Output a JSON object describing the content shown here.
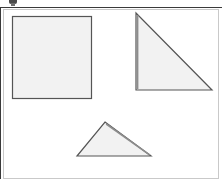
{
  "app": {
    "title": "Shapes Canvas",
    "width": 222,
    "height": 182,
    "background": "#ffffff"
  },
  "toolbar": {
    "nub_label": "",
    "nub_icon": "toolbar-handle-icon"
  },
  "canvas": {
    "frame_color": "#c9c9c9",
    "rule_color": "#3a3a3a",
    "background": "#ffffff"
  },
  "style": {
    "shape_fill": "#f2f2f2",
    "shape_stroke": "#555555",
    "shape_stroke_width": 1.2,
    "shadow_stroke": "#777777"
  },
  "shapes": [
    {
      "id": "square",
      "name": "square",
      "label": "Square",
      "type": "rect",
      "x": 12,
      "y": 16,
      "width": 79,
      "height": 82,
      "fill": "#f2f2f2",
      "stroke": "#555555"
    },
    {
      "id": "right-triangle",
      "name": "right-triangle",
      "label": "Right Triangle",
      "type": "polygon",
      "points": "136,13 136,90 212,90",
      "fill": "#f2f2f2",
      "stroke": "#555555"
    },
    {
      "id": "isosceles-triangle",
      "name": "isosceles-triangle",
      "label": "Isosceles Triangle",
      "type": "polygon",
      "points": "105,122 151,156 77,156",
      "fill": "#f2f2f2",
      "stroke": "#555555"
    }
  ]
}
